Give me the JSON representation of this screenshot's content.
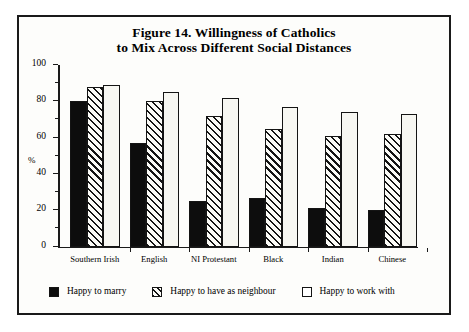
{
  "figure": {
    "title_line_1": "Figure 14. Willingness of Catholics",
    "title_line_2": "to Mix Across Different Social Distances"
  },
  "axis": {
    "y_title": "%",
    "y_ticks": [
      "0",
      "20",
      "40",
      "60",
      "80",
      "100"
    ]
  },
  "legend": {
    "items": [
      {
        "label": "Happy to marry",
        "pattern": "solid-black",
        "color": "#0d0d0d"
      },
      {
        "label": "Happy to have as neighbour",
        "pattern": "diagonal-hatch",
        "color": "#141414"
      },
      {
        "label": "Happy to work with",
        "pattern": "empty-white",
        "color": "#ffffff"
      }
    ]
  },
  "chart_data": {
    "type": "bar",
    "title": "Figure 14. Willingness of Catholics to Mix Across Different Social Distances",
    "xlabel": "",
    "ylabel": "%",
    "ylim": [
      0,
      100
    ],
    "ytick_step": 20,
    "yminor_tick_step": 10,
    "grid": false,
    "legend_position": "bottom",
    "categories": [
      "Southern Irish",
      "English",
      "NI Protestant",
      "Black",
      "Indian",
      "Chinese"
    ],
    "series": [
      {
        "name": "Happy to marry",
        "values": [
          80,
          57,
          25,
          27,
          21,
          20
        ]
      },
      {
        "name": "Happy to have as neighbour",
        "values": [
          88,
          80,
          72,
          65,
          61,
          62
        ]
      },
      {
        "name": "Happy to work with",
        "values": [
          89,
          85,
          82,
          77,
          74,
          73
        ]
      }
    ]
  }
}
